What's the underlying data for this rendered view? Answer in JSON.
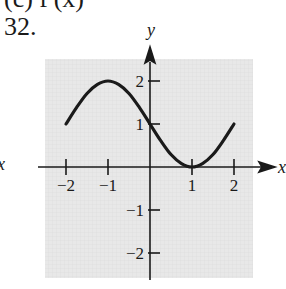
{
  "header": {
    "cut_text": "(c) f′(x)",
    "problem_number": "32."
  },
  "neighbor_axis_label": "x",
  "chart_data": {
    "type": "line",
    "title": "",
    "xlabel": "x",
    "ylabel": "y",
    "xlim": [
      -2,
      2
    ],
    "ylim": [
      -2.2,
      2.2
    ],
    "grid": true,
    "background_color": "#e6e6e6",
    "line_color": "#1a1a1a",
    "x_ticks": [
      -2,
      -1,
      1,
      2
    ],
    "x_tick_labels": [
      "−2",
      "−1",
      "1",
      "2"
    ],
    "y_ticks": [
      2,
      1,
      -1,
      -2
    ],
    "y_tick_labels": [
      "2",
      "1",
      "−1",
      "−2"
    ],
    "function_description": "y = 1 - sin(pi*x/2)",
    "series": [
      {
        "name": "f(x)",
        "x": [
          -2,
          -1.75,
          -1.5,
          -1.25,
          -1,
          -0.75,
          -0.5,
          -0.25,
          0,
          0.25,
          0.5,
          0.75,
          1,
          1.25,
          1.5,
          1.75,
          2
        ],
        "values": [
          1,
          1.38,
          1.71,
          1.92,
          2,
          1.92,
          1.71,
          1.38,
          1,
          0.62,
          0.29,
          0.08,
          0,
          0.08,
          0.29,
          0.62,
          1
        ]
      }
    ]
  }
}
